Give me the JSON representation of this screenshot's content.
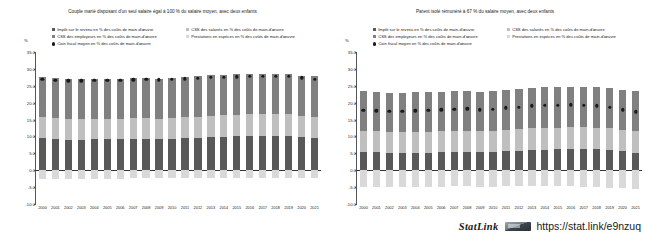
{
  "statlink": {
    "label": "StatLink",
    "icon": "statlink-icon",
    "url": "https://stat.link/e9nzuq"
  },
  "panels": [
    {
      "id": "couple-one-earner",
      "title": "Couple marié disposant d'un seul salaire égal à 100 % du salaire moyen, avec deux enfants",
      "axis_unit": "%"
    },
    {
      "id": "single-parent-67",
      "title": "Parent isolé rémunéré à 67 % du salaire moyen, avec deux enfants",
      "axis_unit": "%"
    }
  ],
  "legend": {
    "column_1": [
      {
        "label": "Impôt sur le revenu en % des coûts de main-d'œuvre",
        "swatch": "square",
        "color": "#595959"
      },
      {
        "label": "CSS des employeurs en % des coûts de main-d'œuvre",
        "swatch": "square",
        "color": "#808080"
      },
      {
        "label": "Coin fiscal moyen en % des coûts de main-d'œuvre",
        "swatch": "dot",
        "color": "#1a1a1a"
      }
    ],
    "column_2": [
      {
        "label": "CSS des salariés en % des coûts de main-d'œuvre",
        "swatch": "square",
        "color": "#bfbfbf"
      },
      {
        "label": "Prestations en espèces en % des coûts de main-d'œuvre",
        "swatch": "square",
        "color": "#d9d9d9"
      }
    ]
  },
  "colors": {
    "income_tax": "#595959",
    "employer_ssc": "#808080",
    "employee_ssc": "#bfbfbf",
    "cash_benefits": "#d9d9d9",
    "tax_wedge_marker": "#1a1a1a",
    "axis": "#555555"
  },
  "chart_data": [
    {
      "type": "bar",
      "id": "couple-one-earner",
      "title": "Couple marié disposant d'un seul salaire égal à 100 % du salaire moyen, avec deux enfants",
      "stacked": true,
      "xlabel": "",
      "ylabel": "%",
      "ylim": [
        -10.0,
        35.0
      ],
      "yticks": [
        "35.0",
        "30.0",
        "25.0",
        "20.0",
        "15.0",
        "10.0",
        "5.0",
        "0.0",
        "-5.0",
        "-10.0"
      ],
      "grid": false,
      "legend_position": "top",
      "categories": [
        "2000",
        "2001",
        "2002",
        "2003",
        "2004",
        "2005",
        "2006",
        "2007",
        "2008",
        "2009",
        "2010",
        "2011",
        "2012",
        "2013",
        "2014",
        "2015",
        "2016",
        "2017",
        "2018",
        "2019",
        "2020",
        "2021"
      ],
      "series": [
        {
          "name": "Impôt sur le revenu en % des coûts de main-d'œuvre",
          "color": "#595959",
          "values": [
            9.6,
            9.3,
            9.0,
            9.0,
            9.1,
            9.1,
            9.1,
            9.2,
            9.3,
            9.1,
            9.2,
            9.4,
            9.6,
            9.8,
            9.9,
            10.0,
            10.1,
            10.2,
            10.2,
            10.1,
            9.8,
            9.6
          ]
        },
        {
          "name": "CSS des salariés en % des coûts de main-d'œuvre",
          "color": "#bfbfbf",
          "values": [
            6.2,
            6.2,
            6.2,
            6.2,
            6.2,
            6.2,
            6.2,
            6.2,
            6.2,
            6.2,
            6.2,
            6.3,
            6.3,
            6.4,
            6.4,
            6.4,
            6.4,
            6.4,
            6.4,
            6.4,
            6.3,
            6.3
          ]
        },
        {
          "name": "CSS des employeurs en % des coûts de main-d'œuvre",
          "color": "#808080",
          "values": [
            11.7,
            11.7,
            11.7,
            11.7,
            11.7,
            11.7,
            11.8,
            11.8,
            11.8,
            11.8,
            11.8,
            11.9,
            11.9,
            12.0,
            12.0,
            12.0,
            12.0,
            12.0,
            12.0,
            12.0,
            11.9,
            11.9
          ]
        },
        {
          "name": "Prestations en espèces en % des coûts de main-d'œuvre",
          "color": "#d9d9d9",
          "values": [
            -2.6,
            -2.6,
            -2.6,
            -2.5,
            -2.5,
            -2.5,
            -2.5,
            -2.4,
            -2.4,
            -2.4,
            -2.4,
            -2.3,
            -2.3,
            -2.3,
            -2.3,
            -2.2,
            -2.2,
            -2.2,
            -2.2,
            -2.2,
            -2.2,
            -2.2
          ]
        }
      ],
      "marker_series": {
        "name": "Coin fiscal moyen en % des coûts de main-d'œuvre",
        "color": "#1a1a1a",
        "values": [
          27.4,
          27.2,
          27.0,
          27.0,
          27.1,
          27.2,
          27.2,
          27.3,
          27.4,
          27.3,
          27.4,
          27.6,
          27.8,
          28.0,
          28.1,
          28.2,
          28.3,
          28.4,
          28.4,
          28.3,
          27.9,
          27.4
        ]
      }
    },
    {
      "type": "bar",
      "id": "single-parent-67",
      "title": "Parent isolé rémunéré à 67 % du salaire moyen, avec deux enfants",
      "stacked": true,
      "xlabel": "",
      "ylabel": "%",
      "ylim": [
        -10.0,
        35.0
      ],
      "yticks": [
        "35.0",
        "30.0",
        "25.0",
        "20.0",
        "15.0",
        "10.0",
        "5.0",
        "0.0",
        "-5.0",
        "-10.0"
      ],
      "grid": false,
      "legend_position": "top",
      "categories": [
        "2000",
        "2001",
        "2002",
        "2003",
        "2004",
        "2005",
        "2006",
        "2007",
        "2008",
        "2009",
        "2010",
        "2011",
        "2012",
        "2013",
        "2014",
        "2015",
        "2016",
        "2017",
        "2018",
        "2019",
        "2020",
        "2021"
      ],
      "series": [
        {
          "name": "Impôt sur le revenu en % des coûts de main-d'œuvre",
          "color": "#595959",
          "values": [
            5.5,
            5.3,
            5.1,
            5.1,
            5.2,
            5.2,
            5.3,
            5.4,
            5.5,
            5.3,
            5.4,
            5.6,
            5.8,
            6.0,
            6.1,
            6.2,
            6.3,
            6.3,
            6.2,
            6.0,
            5.6,
            5.2
          ]
        },
        {
          "name": "CSS des salariés en % des coûts de main-d'œuvre",
          "color": "#bfbfbf",
          "values": [
            6.2,
            6.2,
            6.2,
            6.2,
            6.2,
            6.2,
            6.2,
            6.2,
            6.2,
            6.2,
            6.2,
            6.3,
            6.3,
            6.4,
            6.4,
            6.4,
            6.4,
            6.4,
            6.4,
            6.4,
            6.3,
            6.3
          ]
        },
        {
          "name": "CSS des employeurs en % des coûts de main-d'œuvre",
          "color": "#808080",
          "values": [
            11.7,
            11.7,
            11.7,
            11.7,
            11.7,
            11.7,
            11.8,
            11.8,
            11.8,
            11.8,
            11.8,
            11.9,
            11.9,
            12.0,
            12.0,
            12.0,
            12.0,
            12.0,
            12.0,
            12.0,
            11.9,
            11.9
          ]
        },
        {
          "name": "Prestations en espèces en % des coûts de main-d'œuvre",
          "color": "#d9d9d9",
          "values": [
            -5.1,
            -5.1,
            -5.0,
            -5.0,
            -5.0,
            -4.9,
            -4.9,
            -4.8,
            -4.8,
            -4.9,
            -4.9,
            -4.8,
            -4.8,
            -4.8,
            -4.8,
            -4.8,
            -4.8,
            -4.9,
            -5.0,
            -5.2,
            -5.4,
            -5.6
          ]
        }
      ],
      "marker_series": {
        "name": "Coin fiscal moyen en % des coûts de main-d'œuvre",
        "color": "#1a1a1a",
        "values": [
          18.3,
          18.1,
          18.0,
          18.0,
          18.1,
          18.2,
          18.4,
          18.6,
          18.7,
          18.4,
          18.5,
          19.0,
          19.2,
          19.6,
          19.7,
          19.8,
          19.9,
          19.8,
          19.6,
          19.2,
          18.4,
          17.8
        ]
      }
    }
  ]
}
